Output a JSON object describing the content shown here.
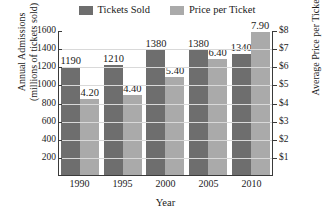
{
  "chart_data": {
    "type": "bar",
    "title": "",
    "categories": [
      "1990",
      "1995",
      "2000",
      "2005",
      "2010"
    ],
    "series": [
      {
        "name": "Tickets Sold",
        "axis": "left",
        "color": "#6e6e6e",
        "values": [
          1190,
          1210,
          1380,
          1380,
          1340
        ],
        "labels": [
          "1190",
          "1210",
          "1380",
          "1380",
          "1340"
        ]
      },
      {
        "name": "Price per Ticket",
        "axis": "right",
        "color": "#aaaaaa",
        "values": [
          4.2,
          4.4,
          5.4,
          6.4,
          7.9
        ],
        "labels": [
          "4.20",
          "4.40",
          "5.40",
          "6.40",
          "7.90"
        ]
      }
    ],
    "xlabel": "Year",
    "ylabel": "Annual Admissions (millions of tickets sold)",
    "ylabel_right": "Average Price per Ticket",
    "ylim": [
      0,
      1600
    ],
    "ylim_right": [
      0,
      8
    ],
    "yticks": [
      1600,
      1400,
      1200,
      1000,
      800,
      600,
      400,
      200
    ],
    "ytick_labels": [
      "1600",
      "1400",
      "1200",
      "1000",
      "800",
      "600",
      "400",
      "200"
    ],
    "yticks_right": [
      8,
      7,
      6,
      5,
      4,
      3,
      2,
      1
    ],
    "ytick_labels_right": [
      "$8",
      "$7",
      "$6",
      "$5",
      "$4",
      "$3",
      "$2",
      "$1"
    ],
    "grid": true,
    "legend_position": "top"
  },
  "axes": {
    "left_title_line1": "Annual Admissions",
    "left_title_line2": "(millions of tickets sold)",
    "right_title": "Average Price per Ticket",
    "x_title": "Year"
  },
  "legend": {
    "items": [
      {
        "label": "Tickets Sold",
        "color": "#6e6e6e"
      },
      {
        "label": "Price per Ticket",
        "color": "#aaaaaa"
      }
    ]
  }
}
